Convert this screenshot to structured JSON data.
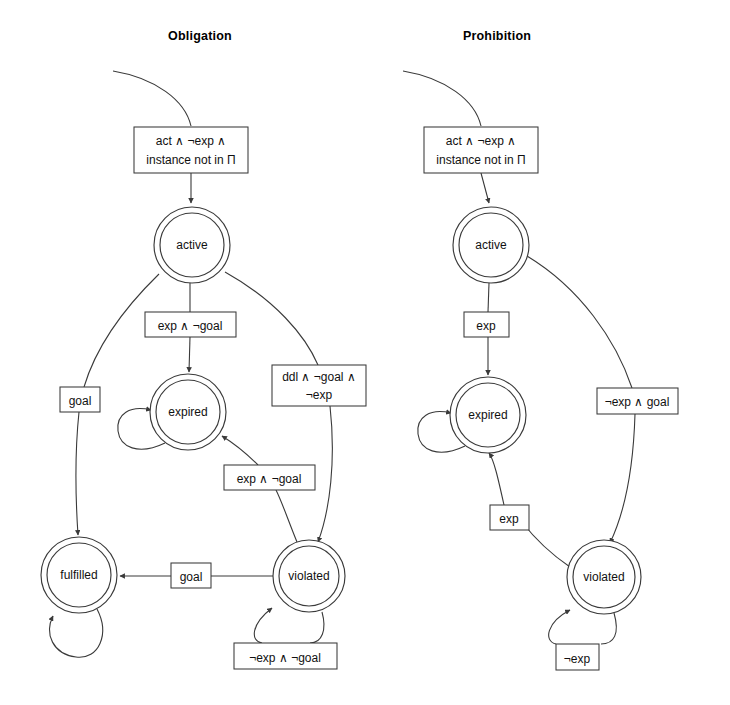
{
  "figure": {
    "type": "state-machine-diagram",
    "background_color": "#ffffff",
    "stroke_color": "#3a3a3a",
    "text_color": "#111111"
  },
  "panels": [
    {
      "id": "obligation",
      "title": "Obligation",
      "title_x": 200,
      "title_y": 40,
      "states": [
        {
          "id": "active",
          "label": "active",
          "cx": 192,
          "cy": 245,
          "r_outer": 38,
          "r_inner": 32
        },
        {
          "id": "expired",
          "label": "expired",
          "cx": 188,
          "cy": 412,
          "r_outer": 38,
          "r_inner": 32
        },
        {
          "id": "fulfilled",
          "label": "fulfilled",
          "cx": 79,
          "cy": 575,
          "r_outer": 38,
          "r_inner": 32
        },
        {
          "id": "violated",
          "label": "violated",
          "cx": 309,
          "cy": 576,
          "r_outer": 36,
          "r_inner": 30
        }
      ],
      "guards": [
        {
          "id": "init",
          "lines": [
            "act ∧ ¬exp ∧",
            "instance not in Π"
          ],
          "x": 134,
          "y": 127,
          "w": 114,
          "h": 46
        },
        {
          "id": "active-expired",
          "lines": [
            "exp ∧ ¬goal"
          ],
          "x": 145,
          "y": 312,
          "w": 91,
          "h": 25
        },
        {
          "id": "active-violated",
          "lines": [
            "ddl ∧ ¬goal ∧",
            "¬exp"
          ],
          "x": 272,
          "y": 365,
          "w": 94,
          "h": 41
        },
        {
          "id": "active-fulfilled",
          "lines": [
            "goal"
          ],
          "x": 60,
          "y": 387,
          "w": 40,
          "h": 25
        },
        {
          "id": "violated-expired",
          "lines": [
            "exp ∧ ¬goal"
          ],
          "x": 224,
          "y": 465,
          "w": 91,
          "h": 25
        },
        {
          "id": "violated-fulfilled",
          "lines": [
            "goal"
          ],
          "x": 171,
          "y": 563,
          "w": 40,
          "h": 25
        },
        {
          "id": "violated-self",
          "lines": [
            "¬exp ∧ ¬goal"
          ],
          "x": 234,
          "y": 643,
          "w": 103,
          "h": 26
        }
      ],
      "transitions": [
        {
          "id": "start-init",
          "from": "start",
          "to": "init"
        },
        {
          "id": "init-active",
          "from": "init",
          "to": "active",
          "guard": "act ∧ ¬exp ∧ instance not in Π"
        },
        {
          "id": "active-expired",
          "from": "active",
          "to": "expired",
          "guard": "exp ∧ ¬goal"
        },
        {
          "id": "active-violated",
          "from": "active",
          "to": "violated",
          "guard": "ddl ∧ ¬goal ∧ ¬exp"
        },
        {
          "id": "active-fulfilled",
          "from": "active",
          "to": "fulfilled",
          "guard": "goal"
        },
        {
          "id": "violated-expired",
          "from": "violated",
          "to": "expired",
          "guard": "exp ∧ ¬goal"
        },
        {
          "id": "violated-fulfilled",
          "from": "violated",
          "to": "fulfilled",
          "guard": "goal"
        },
        {
          "id": "violated-self",
          "from": "violated",
          "to": "violated",
          "guard": "¬exp ∧ ¬goal"
        },
        {
          "id": "expired-self",
          "from": "expired",
          "to": "expired",
          "guard": ""
        },
        {
          "id": "fulfilled-self",
          "from": "fulfilled",
          "to": "fulfilled",
          "guard": ""
        }
      ]
    },
    {
      "id": "prohibition",
      "title": "Prohibition",
      "title_x": 497,
      "title_y": 40,
      "states": [
        {
          "id": "active",
          "label": "active",
          "cx": 491,
          "cy": 245,
          "r_outer": 38,
          "r_inner": 32
        },
        {
          "id": "expired",
          "label": "expired",
          "cx": 488,
          "cy": 415,
          "r_outer": 38,
          "r_inner": 32
        },
        {
          "id": "violated",
          "label": "violated",
          "cx": 604,
          "cy": 577,
          "r_outer": 37,
          "r_inner": 31
        }
      ],
      "guards": [
        {
          "id": "init",
          "lines": [
            "act ∧ ¬exp ∧",
            "instance not in Π"
          ],
          "x": 424,
          "y": 127,
          "w": 114,
          "h": 46
        },
        {
          "id": "active-expired",
          "lines": [
            "exp"
          ],
          "x": 464,
          "y": 312,
          "w": 45,
          "h": 25
        },
        {
          "id": "active-violated",
          "lines": [
            "¬exp ∧ goal"
          ],
          "x": 597,
          "y": 388,
          "w": 81,
          "h": 26
        },
        {
          "id": "violated-expired",
          "lines": [
            "exp"
          ],
          "x": 490,
          "y": 505,
          "w": 39,
          "h": 25
        },
        {
          "id": "violated-self",
          "lines": [
            "¬exp"
          ],
          "x": 556,
          "y": 644,
          "w": 43,
          "h": 26
        }
      ],
      "transitions": [
        {
          "id": "start-init",
          "from": "start",
          "to": "init"
        },
        {
          "id": "init-active",
          "from": "init",
          "to": "active",
          "guard": "act ∧ ¬exp ∧ instance not in Π"
        },
        {
          "id": "active-expired",
          "from": "active",
          "to": "expired",
          "guard": "exp"
        },
        {
          "id": "active-violated",
          "from": "active",
          "to": "violated",
          "guard": "¬exp ∧ goal"
        },
        {
          "id": "violated-expired",
          "from": "violated",
          "to": "expired",
          "guard": "exp"
        },
        {
          "id": "violated-self",
          "from": "violated",
          "to": "violated",
          "guard": "¬exp"
        },
        {
          "id": "expired-self",
          "from": "expired",
          "to": "expired",
          "guard": ""
        }
      ]
    }
  ]
}
